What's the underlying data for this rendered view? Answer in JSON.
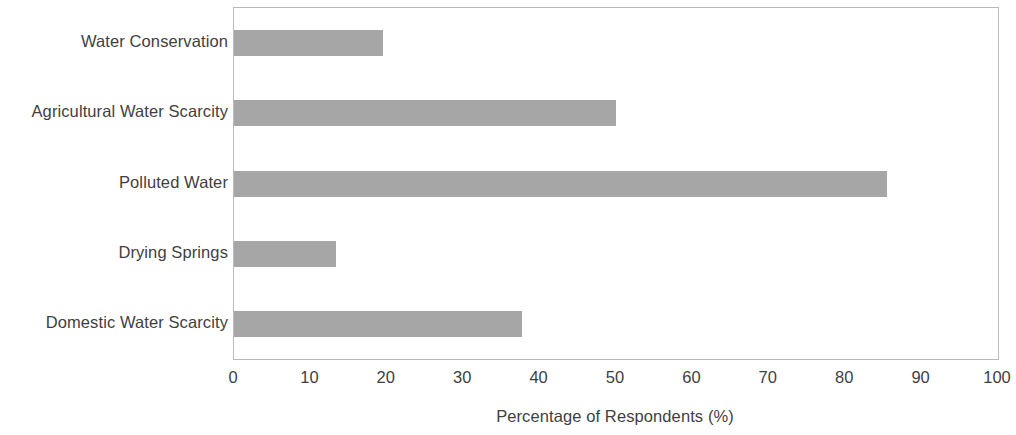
{
  "chart_data": {
    "type": "bar",
    "orientation": "horizontal",
    "title": "",
    "xlabel": "Percentage of Respondents (%)",
    "ylabel": "",
    "xlim": [
      0,
      100
    ],
    "xticks": [
      "0",
      "10",
      "20",
      "30",
      "40",
      "50",
      "60",
      "70",
      "80",
      "90",
      "100"
    ],
    "xtick_values": [
      0,
      10,
      20,
      30,
      40,
      50,
      60,
      70,
      80,
      90,
      100
    ],
    "grid": false,
    "legend": false,
    "bar_color": "#a6a6a6",
    "plot_border_color": "#b9b9b9",
    "categories": [
      "Water Conservation",
      "Agricultural Water Scarcity",
      "Polluted Water",
      "Drying Springs",
      "Domestic Water Scarcity"
    ],
    "values": [
      19.5,
      50,
      85.5,
      13.4,
      37.7
    ]
  }
}
